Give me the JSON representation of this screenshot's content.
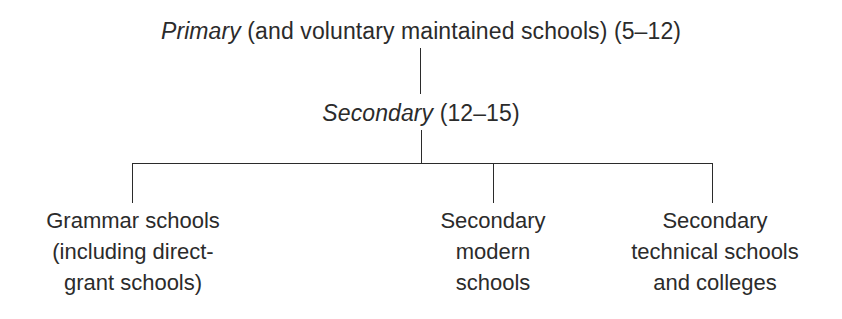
{
  "diagram": {
    "type": "tree",
    "orientation": "top-down",
    "background_color": "#ffffff",
    "line_color": "#2b2b2b",
    "text_color": "#2b2b2b",
    "levels": [
      {
        "level": 1,
        "node": {
          "term": "Primary",
          "term_style": "italic",
          "detail": " (and voluntary maintained schools) (5–12)",
          "age_range": "5–12",
          "full_text": "Primary (and voluntary maintained schools) (5–12)"
        }
      },
      {
        "level": 2,
        "node": {
          "term": "Secondary",
          "term_style": "italic",
          "detail": " (12–15)",
          "age_range": "12–15",
          "full_text": "Secondary (12–15)"
        }
      },
      {
        "level": 3,
        "nodes": [
          {
            "id": "grammar",
            "lines": [
              "Grammar schools",
              "(including direct-",
              "grant schools)"
            ],
            "full_text": "Grammar schools (including direct-grant schools)"
          },
          {
            "id": "secondary-modern",
            "lines": [
              "Secondary",
              "modern",
              "schools"
            ],
            "full_text": "Secondary modern schools"
          },
          {
            "id": "secondary-technical",
            "lines": [
              "Secondary",
              "technical schools",
              "and colleges"
            ],
            "full_text": "Secondary technical schools and colleges"
          }
        ]
      }
    ],
    "connectors": {
      "stem_primary_to_secondary": {
        "x": 420,
        "y1": 48,
        "y2": 94
      },
      "stem_secondary_to_bus": {
        "x": 421,
        "y1": 130,
        "y2": 163
      },
      "bus_bar": {
        "y": 163,
        "x1": 132,
        "x2": 713
      },
      "drops": [
        {
          "x": 132,
          "y1": 163,
          "y2": 203
        },
        {
          "x": 493,
          "y1": 163,
          "y2": 203
        },
        {
          "x": 713,
          "y1": 163,
          "y2": 203
        }
      ]
    }
  }
}
